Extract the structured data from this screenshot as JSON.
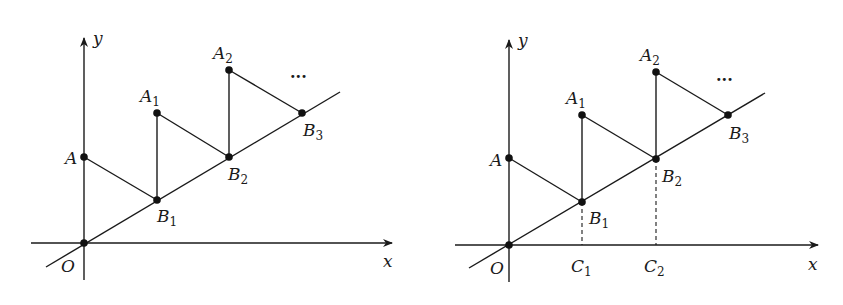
{
  "figures": [
    {
      "id": "left",
      "axis_labels": {
        "x": "x",
        "y": "y"
      },
      "origin_label": "O",
      "points": [
        {
          "name": "A",
          "main": "A",
          "sub": ""
        },
        {
          "name": "A1",
          "main": "A",
          "sub": "1"
        },
        {
          "name": "A2",
          "main": "A",
          "sub": "2"
        },
        {
          "name": "B1",
          "main": "B",
          "sub": "1"
        },
        {
          "name": "B2",
          "main": "B",
          "sub": "2"
        },
        {
          "name": "B3",
          "main": "B",
          "sub": "3"
        }
      ],
      "continuation": "···"
    },
    {
      "id": "right",
      "axis_labels": {
        "x": "x",
        "y": "y"
      },
      "origin_label": "O",
      "points": [
        {
          "name": "A",
          "main": "A",
          "sub": ""
        },
        {
          "name": "A1",
          "main": "A",
          "sub": "1"
        },
        {
          "name": "A2",
          "main": "A",
          "sub": "2"
        },
        {
          "name": "B1",
          "main": "B",
          "sub": "1"
        },
        {
          "name": "B2",
          "main": "B",
          "sub": "2"
        },
        {
          "name": "B3",
          "main": "B",
          "sub": "3"
        },
        {
          "name": "C1",
          "main": "C",
          "sub": "1"
        },
        {
          "name": "C2",
          "main": "C",
          "sub": "2"
        }
      ],
      "continuation": "···"
    }
  ]
}
